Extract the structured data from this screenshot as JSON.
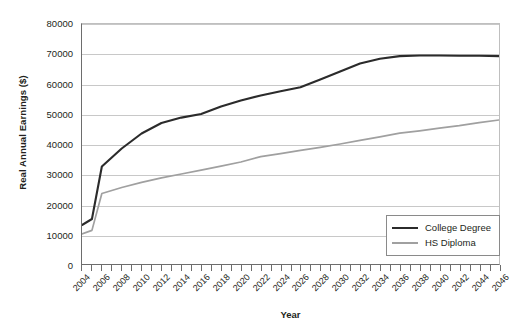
{
  "chart_data": {
    "type": "line",
    "title": "",
    "xlabel": "Year",
    "ylabel": "Real Annual Earnings ($)",
    "xlim": [
      2004,
      2046
    ],
    "ylim": [
      0,
      80000
    ],
    "grid": true,
    "legend_position": "bottom-right-inside",
    "y_ticks": [
      0,
      10000,
      20000,
      30000,
      40000,
      50000,
      60000,
      70000,
      80000
    ],
    "y_tick_labels": [
      "0",
      "10000",
      "20000",
      "30000",
      "40000",
      "50000",
      "60000",
      "70000",
      "80000"
    ],
    "x_ticks": [
      2004,
      2005,
      2006,
      2007,
      2008,
      2009,
      2010,
      2011,
      2012,
      2013,
      2014,
      2015,
      2016,
      2017,
      2018,
      2019,
      2020,
      2021,
      2022,
      2023,
      2024,
      2025,
      2026,
      2027,
      2028,
      2029,
      2030,
      2031,
      2032,
      2033,
      2034,
      2035,
      2036,
      2037,
      2038,
      2039,
      2040,
      2041,
      2042,
      2043,
      2044,
      2045,
      2046
    ],
    "x_tick_labels": [
      "2004",
      "2006",
      "2008",
      "2010",
      "2012",
      "2014",
      "2016",
      "2018",
      "2020",
      "2022",
      "2024",
      "2026",
      "2028",
      "2030",
      "2032",
      "2034",
      "2036",
      "2038",
      "2040",
      "2042",
      "2044",
      "2046"
    ],
    "x_tick_label_values": [
      2004,
      2006,
      2008,
      2010,
      2012,
      2014,
      2016,
      2018,
      2020,
      2022,
      2024,
      2026,
      2028,
      2030,
      2032,
      2034,
      2036,
      2038,
      2040,
      2042,
      2044,
      2046
    ],
    "x": [
      2004,
      2005,
      2006,
      2008,
      2010,
      2012,
      2014,
      2016,
      2018,
      2020,
      2022,
      2024,
      2026,
      2028,
      2030,
      2032,
      2034,
      2036,
      2038,
      2040,
      2042,
      2044,
      2046
    ],
    "series": [
      {
        "name": "College Degree",
        "color": "#2b2b2b",
        "width": 2.1,
        "values": [
          13000,
          15000,
          32500,
          38500,
          43500,
          47000,
          48800,
          50000,
          52500,
          54500,
          56200,
          57600,
          58900,
          61500,
          64200,
          66800,
          68400,
          69300,
          69500,
          69500,
          69400,
          69400,
          69300
        ]
      },
      {
        "name": "HS Diploma",
        "color": "#a0a0a0",
        "width": 1.7,
        "values": [
          10000,
          11200,
          23500,
          25500,
          27200,
          28700,
          30000,
          31300,
          32600,
          34000,
          35800,
          36800,
          37900,
          38900,
          40000,
          41200,
          42400,
          43600,
          44400,
          45300,
          46100,
          47100,
          48000
        ]
      }
    ]
  },
  "legend": {
    "items": [
      {
        "label": "College Degree"
      },
      {
        "label": "HS Diploma"
      }
    ]
  }
}
